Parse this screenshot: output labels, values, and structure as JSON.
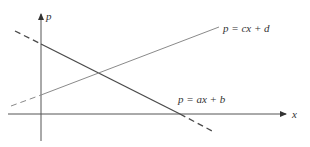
{
  "diagram": {
    "axes": {
      "horizontal_label": "x",
      "vertical_label": "p"
    },
    "lines": [
      {
        "id": "supply",
        "label": "p = cx + d",
        "slope_sign": "positive"
      },
      {
        "id": "demand",
        "label": "p = ax + b",
        "slope_sign": "negative"
      }
    ],
    "colors": {
      "axis": "#555555",
      "line_ax_b": "#4a4a4a",
      "line_cx_d": "#8a8a8a"
    }
  }
}
